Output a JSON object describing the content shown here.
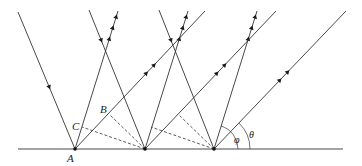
{
  "diagram": {
    "type": "surface-diffraction-geometry",
    "colors": {
      "line": "#333333",
      "background": "#ffffff"
    },
    "surface": {
      "x1": 18,
      "x2": 343,
      "y": 149
    },
    "points": {
      "A": {
        "x": 75,
        "y": 149,
        "label": "A"
      },
      "P2": {
        "x": 145,
        "y": 149
      },
      "P3": {
        "x": 214,
        "y": 149
      },
      "B": {
        "x": 110,
        "y": 115,
        "label": "B"
      },
      "C": {
        "x": 82,
        "y": 127,
        "label": "C"
      }
    },
    "incident_rays": [
      {
        "from": [
          18,
          12
        ],
        "to": [
          75,
          149
        ]
      },
      {
        "from": [
          89,
          10
        ],
        "to": [
          145,
          149
        ]
      },
      {
        "from": [
          159,
          10
        ],
        "to": [
          214,
          149
        ]
      }
    ],
    "steep_reflected_rays": [
      {
        "from": [
          75,
          149
        ],
        "to": [
          118,
          11
        ]
      },
      {
        "from": [
          145,
          149
        ],
        "to": [
          188,
          11
        ]
      },
      {
        "from": [
          214,
          149
        ],
        "to": [
          257,
          11
        ]
      }
    ],
    "shallow_reflected_rays": [
      {
        "from": [
          75,
          149
        ],
        "to": [
          205,
          11
        ]
      },
      {
        "from": [
          145,
          149
        ],
        "to": [
          276,
          11
        ]
      },
      {
        "from": [
          214,
          149
        ],
        "to": [
          346,
          11
        ]
      }
    ],
    "dashed_lines": [
      {
        "from": [
          145,
          149
        ],
        "to": [
          110,
          115
        ]
      },
      {
        "from": [
          145,
          149
        ],
        "to": [
          82,
          127
        ]
      },
      {
        "from": [
          214,
          149
        ],
        "to": [
          179,
          115
        ]
      },
      {
        "from": [
          214,
          149
        ],
        "to": [
          151,
          127
        ]
      }
    ],
    "angles": [
      {
        "label": "φ",
        "vertex": [
          214,
          149
        ],
        "radius": 24
      },
      {
        "label": "θ",
        "vertex": [
          214,
          149
        ],
        "radius": 36
      }
    ],
    "labels": {
      "A": "A",
      "B": "B",
      "C": "C",
      "phi": "φ",
      "theta": "θ"
    }
  }
}
